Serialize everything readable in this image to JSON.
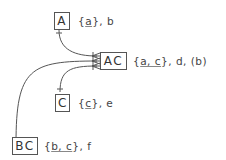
{
  "nodes": [
    {
      "id": "A",
      "name": "A",
      "attrs_prefix": "{",
      "key": "a",
      "attrs_suffix": "}, b"
    },
    {
      "id": "AC",
      "name": "AC",
      "attrs_prefix": "{",
      "key": "a, c",
      "attrs_suffix": "}, d, (b)"
    },
    {
      "id": "C",
      "name": "C",
      "attrs_prefix": "{",
      "key": "c",
      "attrs_suffix": "}, e"
    },
    {
      "id": "BC",
      "name": "BC",
      "attrs_prefix": "{",
      "key": "b, c",
      "attrs_suffix": "}, f"
    }
  ],
  "edges": [
    {
      "from": "AC",
      "to": "A",
      "from_end": "crows-foot",
      "to_end": "one"
    },
    {
      "from": "AC",
      "to": "C",
      "from_end": "crows-foot",
      "to_end": "one"
    },
    {
      "from": "AC",
      "to": "BC",
      "from_end": "crows-foot",
      "to_end": "one"
    }
  ],
  "colors": {
    "line": "#555555",
    "text": "#444444"
  }
}
